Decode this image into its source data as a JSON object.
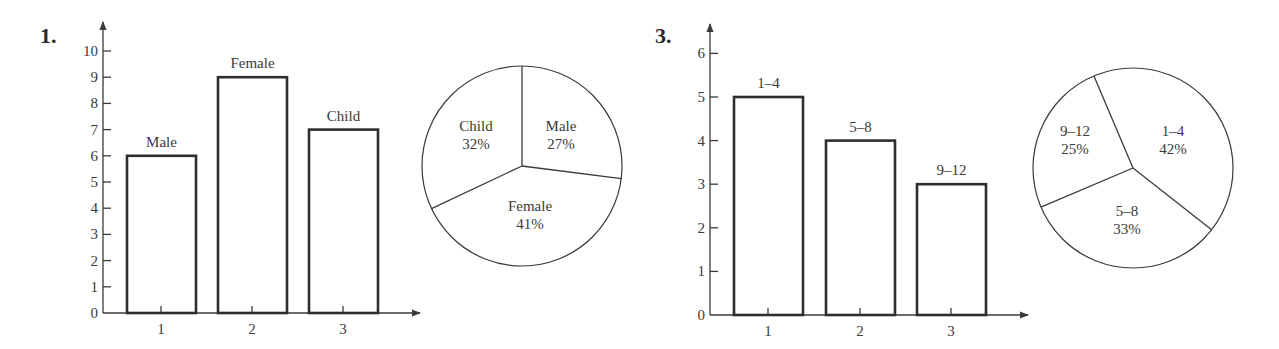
{
  "chart_data": [
    {
      "id": "problem-1-bar",
      "problem_number": "1.",
      "type": "bar",
      "title": "",
      "xlabel": "",
      "ylabel": "",
      "categories": [
        "1",
        "2",
        "3"
      ],
      "values": [
        6,
        9,
        7
      ],
      "bar_labels": [
        "Male",
        "Female",
        "Child"
      ],
      "yticks": [
        0,
        1,
        2,
        3,
        4,
        5,
        6,
        7,
        8,
        9,
        10
      ],
      "ylim": [
        0,
        10
      ],
      "grid": false,
      "layout": {
        "axis_x": 103,
        "baseline_y": 313,
        "unit_px": 26.2,
        "axis_top_y": 22,
        "axis_right_x": 420,
        "bar_lefts": [
          127,
          218,
          309
        ],
        "bar_width": 69,
        "tick_xs": [
          161,
          252,
          343
        ],
        "label_x": 40,
        "label_y": 43
      }
    },
    {
      "id": "problem-1-pie",
      "type": "pie",
      "title": "",
      "slices": [
        {
          "label": "Male",
          "percent": "27%",
          "value": 27
        },
        {
          "label": "Female",
          "percent": "41%",
          "value": 41
        },
        {
          "label": "Child",
          "percent": "32%",
          "value": 32
        }
      ],
      "layout": {
        "cx": 522,
        "cy": 166,
        "r": 100,
        "start_angle_deg": -90,
        "label_positions": [
          [
            561,
            131
          ],
          [
            530,
            211
          ],
          [
            476,
            131
          ]
        ]
      }
    },
    {
      "id": "problem-3-bar",
      "problem_number": "3.",
      "type": "bar",
      "title": "",
      "xlabel": "",
      "ylabel": "",
      "categories": [
        "1",
        "2",
        "3"
      ],
      "values": [
        5,
        4,
        3
      ],
      "bar_labels": [
        "1–4",
        "5–8",
        "9–12"
      ],
      "yticks": [
        0,
        1,
        2,
        3,
        4,
        5,
        6
      ],
      "ylim": [
        0,
        6
      ],
      "grid": false,
      "layout": {
        "axis_x": 710,
        "baseline_y": 315,
        "unit_px": 43.6,
        "axis_top_y": 24,
        "axis_right_x": 1028,
        "bar_lefts": [
          734,
          826,
          917
        ],
        "bar_width": 69,
        "tick_xs": [
          768,
          860,
          951
        ],
        "label_x": 655,
        "label_y": 43
      }
    },
    {
      "id": "problem-3-pie",
      "type": "pie",
      "title": "",
      "slices": [
        {
          "label": "1–4",
          "percent": "42%",
          "value": 42
        },
        {
          "label": "5–8",
          "percent": "33%",
          "value": 33
        },
        {
          "label": "9–12",
          "percent": "25%",
          "value": 25
        }
      ],
      "layout": {
        "cx": 1133,
        "cy": 168,
        "r": 100,
        "start_angle_deg": -113,
        "label_positions": [
          [
            1173,
            136
          ],
          [
            1127,
            216
          ],
          [
            1075,
            136
          ]
        ]
      }
    }
  ]
}
